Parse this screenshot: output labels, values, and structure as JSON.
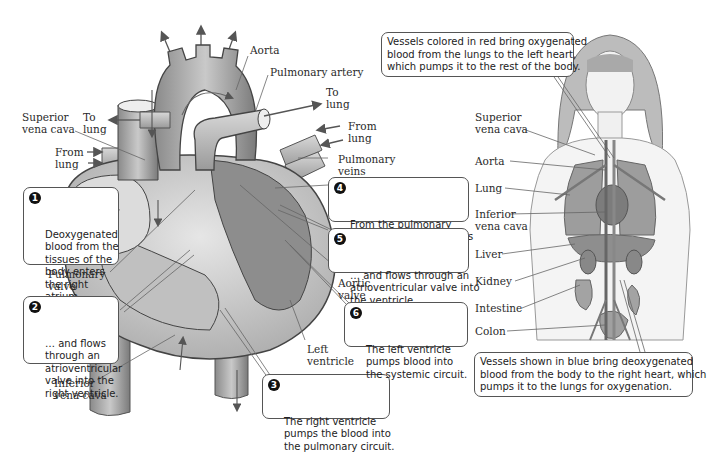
{
  "heart_labels": {
    "aorta": "Aorta",
    "pulmonary_artery": "Pulmonary artery",
    "to_lung_right": "To\nlung",
    "to_lung_left": "To\nlung",
    "superior_vena_cava": "Superior\nvena cava",
    "from_lung_left": "From\nlung",
    "from_lung_right": "From\nlung",
    "pulmonary_veins": "Pulmonary\nveins",
    "pulmonary_valve": "Pulmonary\nvalve",
    "inferior_vena_cava": "Inferior\nvena cava",
    "aortic_valve": "Aortic\nvalve",
    "left_ventricle": "Left\nventricle"
  },
  "steps": [
    {
      "num": "1",
      "text": "Deoxygenated\nblood from the\ntissues of the\nbody enters\nthe right\natrium…"
    },
    {
      "num": "2",
      "text": "… and flows\nthrough an\natrioventricular\nvalve into the\nright ventricle."
    },
    {
      "num": "3",
      "text": "The right ventricle\npumps the blood into\nthe pulmonary circuit."
    },
    {
      "num": "4",
      "text": "From the pulmonary\ncircuit, the blood returns\nto the left atrium…"
    },
    {
      "num": "5",
      "text": "… and flows through an\natrioventricular valve into\nthe ventricle."
    },
    {
      "num": "6",
      "text": "The left ventricle\npumps blood into\nthe systemic circuit."
    }
  ],
  "body_labels": {
    "superior_vena_cava": "Superior\nvena cava",
    "aorta": "Aorta",
    "lung": "Lung",
    "inferior_vena_cava": "Inferior\nvena cava",
    "liver": "Liver",
    "kidney": "Kidney",
    "intestine": "Intestine",
    "colon": "Colon"
  },
  "notes": {
    "red_vessels": "Vessels colored in red bring oxygenated\nblood from the lungs to the left heart,\nwhich pumps it to the rest of the body.",
    "blue_vessels": "Vessels shown in blue bring deoxygenated\nblood from the body to the right heart, which\npumps it to the lungs for oxygenation."
  }
}
